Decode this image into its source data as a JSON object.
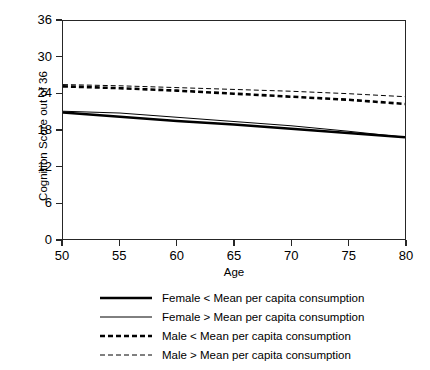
{
  "chart_data": {
    "type": "line",
    "title": "",
    "xlabel": "Age",
    "ylabel": "Cognition Score out of 36",
    "xlim": [
      50,
      80
    ],
    "ylim": [
      0,
      36
    ],
    "xticks": [
      50,
      55,
      60,
      65,
      70,
      75,
      80
    ],
    "yticks": [
      0,
      6,
      12,
      18,
      24,
      30,
      36
    ],
    "grid": false,
    "legend_position": "below",
    "x": [
      50,
      55,
      60,
      65,
      70,
      75,
      80
    ],
    "series": [
      {
        "name": "Female < Mean per capita consumption",
        "style": "solid-thick",
        "linewidth": 2.6,
        "dash": "none",
        "color": "#000000",
        "values": [
          20.9,
          20.2,
          19.5,
          18.9,
          18.2,
          17.5,
          16.8
        ]
      },
      {
        "name": "Female > Mean per capita consumption",
        "style": "solid-thin",
        "linewidth": 1.0,
        "dash": "none",
        "color": "#000000",
        "values": [
          21.1,
          20.8,
          20.1,
          19.4,
          18.7,
          17.8,
          16.8
        ]
      },
      {
        "name": "Male < Mean per capita consumption",
        "style": "dashed-thick",
        "linewidth": 2.6,
        "dash": "5,3",
        "color": "#000000",
        "values": [
          25.2,
          24.9,
          24.5,
          24.0,
          23.5,
          23.0,
          22.3
        ]
      },
      {
        "name": "Male > Mean per capita consumption",
        "style": "dashed-thin",
        "linewidth": 1.0,
        "dash": "5,3",
        "color": "#000000",
        "values": [
          25.5,
          25.3,
          25.0,
          24.7,
          24.4,
          24.0,
          23.5
        ]
      }
    ]
  },
  "axes": {
    "xlabel": "Age",
    "ylabel": "Cognition Score out of 36"
  },
  "legend": {
    "items": [
      {
        "label": "Female < Mean per capita consumption"
      },
      {
        "label": "Female > Mean per capita consumption"
      },
      {
        "label": "Male < Mean per capita consumption"
      },
      {
        "label": "Male > Mean per capita consumption"
      }
    ]
  },
  "colors": {
    "line": "#000000",
    "axis": "#262626",
    "background": "#ffffff"
  }
}
